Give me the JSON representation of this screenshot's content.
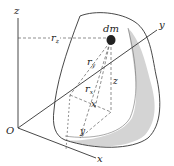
{
  "diagram": {
    "type": "moment-of-inertia-body",
    "labels": {
      "z_axis": "z",
      "y_axis": "y",
      "x_axis": "x",
      "origin": "O",
      "mass_element": "dm",
      "rz_base": "r",
      "rz_sub": "z",
      "ry_base": "r",
      "ry_sub": "y",
      "rx_base": "r",
      "rx_sub": "x",
      "coord_z": "z",
      "coord_x": "x",
      "coord_y": "y"
    },
    "colors": {
      "line": "#333333",
      "body_fill": "#ffffff",
      "body_shade": "#d4d4d4",
      "point": "#222222"
    }
  }
}
